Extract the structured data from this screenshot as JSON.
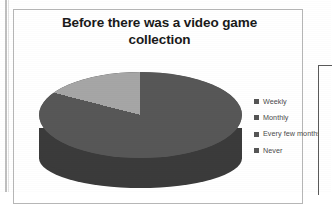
{
  "chart": {
    "title": "Before there was a video game collection",
    "title_line1": "Before there was a video game",
    "title_line2": "collection"
  },
  "legend": {
    "items": [
      {
        "label": "Weekly",
        "color": "#555555"
      },
      {
        "label": "Monthly",
        "color": "#555555"
      },
      {
        "label": "Every few months",
        "color": "#555555"
      },
      {
        "label": "Never",
        "color": "#555555"
      }
    ]
  },
  "colors": {
    "slice_dark": "#575757",
    "slice_light": "#a6a6a6",
    "side_wall": "#3b3b3b",
    "frame_border": "#b6b6b6",
    "title_text": "#1a1a1a",
    "legend_text": "#4a4a4a",
    "background": "#ffffff"
  },
  "chart_data": {
    "type": "pie",
    "title": "Before there was a video game collection",
    "three_d": true,
    "legend_position": "right",
    "categories": [
      "Weekly",
      "Monthly",
      "Every few months",
      "Never"
    ],
    "values": [
      0,
      0,
      21,
      79
    ],
    "value_unit": "percent",
    "slice_colors": [
      "#808080",
      "#6e6e6e",
      "#a6a6a6",
      "#575757"
    ],
    "visible_slices": [
      {
        "name": "Every few months",
        "percent": 21,
        "color": "#a6a6a6"
      },
      {
        "name": "Never",
        "percent": 79,
        "color": "#575757"
      }
    ],
    "labels_shown": false,
    "grid": false
  }
}
